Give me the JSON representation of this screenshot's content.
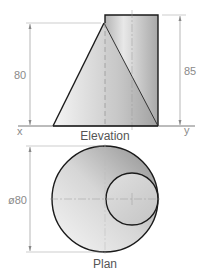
{
  "elevation": {
    "title": "Elevation",
    "x_label": "x",
    "y_label": "y",
    "cone_height_label": "80",
    "cylinder_height_label": "85"
  },
  "plan": {
    "title": "Plan",
    "diameter_label": "ø80"
  },
  "colors": {
    "outline": "#1a1a1a",
    "dimension": "#8a8a8a",
    "shade_dark": "#9a9a9a",
    "shade_light": "#f2f2f2"
  }
}
